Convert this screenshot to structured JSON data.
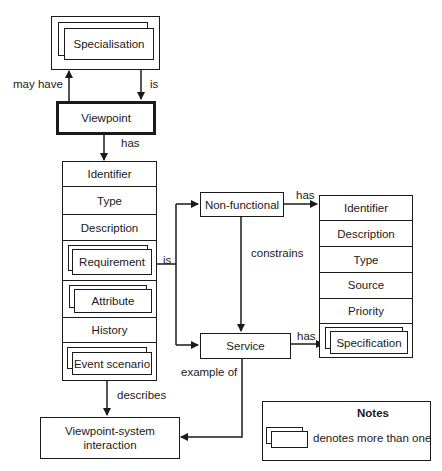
{
  "diagram": {
    "nodes": {
      "specialisation": "Specialisation",
      "viewpoint": "Viewpoint",
      "non_functional": "Non-functional",
      "service": "Service",
      "interaction_line1": "Viewpoint-system",
      "interaction_line2": "interaction"
    },
    "viewpoint_attributes": [
      {
        "label": "Identifier",
        "multiple": false
      },
      {
        "label": "Type",
        "multiple": false
      },
      {
        "label": "Description",
        "multiple": false
      },
      {
        "label": "Requirement",
        "multiple": true
      },
      {
        "label": "Attribute",
        "multiple": true
      },
      {
        "label": "History",
        "multiple": false
      },
      {
        "label": "Event scenario",
        "multiple": true
      }
    ],
    "requirement_attributes": [
      {
        "label": "Identifier",
        "multiple": false
      },
      {
        "label": "Description",
        "multiple": false
      },
      {
        "label": "Type",
        "multiple": false
      },
      {
        "label": "Source",
        "multiple": false
      },
      {
        "label": "Priority",
        "multiple": false
      },
      {
        "label": "Specification",
        "multiple": true
      }
    ],
    "edges": {
      "may_have": "may have",
      "is_specialisation": "is",
      "has_viewpoint": "has",
      "is_requirement": "is",
      "constrains": "constrains",
      "has_nonfunctional": "has",
      "has_service": "has",
      "example_of": "example of",
      "describes": "describes"
    },
    "notes": {
      "title": "Notes",
      "text": "denotes more than one"
    }
  }
}
